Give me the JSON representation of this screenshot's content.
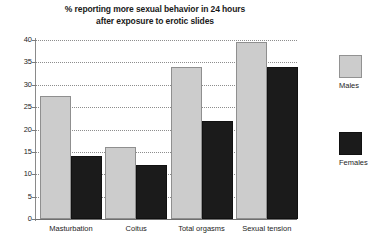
{
  "chart_data": {
    "type": "bar",
    "title": "% reporting more sexual behavior in 24 hours after exposure to erotic slides",
    "title_lines": [
      "% reporting more sexual behavior in 24 hours",
      "after exposure to erotic slides"
    ],
    "xlabel": "",
    "ylabel": "",
    "ylim": [
      0,
      40
    ],
    "yticks": [
      0,
      5,
      10,
      15,
      20,
      25,
      30,
      35,
      40
    ],
    "ytick_labels": [
      "0",
      "5",
      "10",
      "15",
      "20",
      "25",
      "30",
      "35",
      "40"
    ],
    "grid": true,
    "grid_style": "dotted-horizontal",
    "legend_position": "right",
    "categories": [
      "Masturbation",
      "Coitus",
      "Total orgasms",
      "Sexual tension"
    ],
    "series": [
      {
        "name": "Males",
        "color": "#cccccc",
        "values": [
          27.5,
          16,
          34,
          39.5
        ]
      },
      {
        "name": "Females",
        "color": "#1b1b1b",
        "values": [
          14,
          12,
          22,
          34
        ]
      }
    ]
  },
  "colors": {
    "males": "#cccccc",
    "females": "#1b1b1b",
    "grid": "#8d8d8d",
    "axis": "#7a7a7a",
    "text": "#1d1d1d",
    "background": "#ffffff"
  }
}
